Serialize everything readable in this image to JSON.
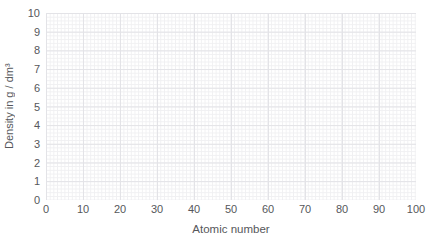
{
  "chart_data": {
    "type": "scatter",
    "title": "",
    "xlabel": "Atomic number",
    "ylabel": "Density in g / dm³",
    "xlim": [
      0,
      100
    ],
    "ylim": [
      0,
      10
    ],
    "x_ticks": [
      0,
      10,
      20,
      30,
      40,
      50,
      60,
      70,
      80,
      90,
      100
    ],
    "y_ticks": [
      0,
      1,
      2,
      3,
      4,
      5,
      6,
      7,
      8,
      9,
      10
    ],
    "grid": {
      "minor": true,
      "major": true,
      "style": "fine graph-paper grid, no axis lines, no border"
    },
    "legend": "none",
    "series": []
  },
  "colors": {
    "background": "#ffffff",
    "text": "#56575b",
    "grid_minor": "#f0f0f2",
    "grid_major": "#e3e3e7"
  }
}
